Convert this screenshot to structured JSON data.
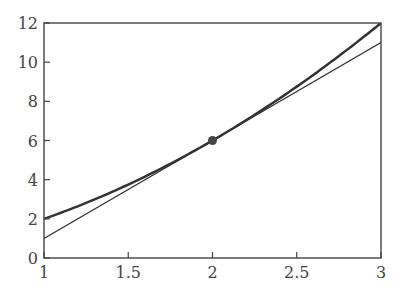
{
  "chart_data": {
    "type": "line",
    "title": "",
    "xlabel": "",
    "ylabel": "",
    "xlim": [
      1,
      3
    ],
    "ylim": [
      0,
      12
    ],
    "grid": false,
    "legend": null,
    "x_ticks": [
      1,
      1.5,
      2,
      2.5,
      3
    ],
    "x_tick_labels": [
      "1",
      "1.5",
      "2",
      "2.5",
      "3"
    ],
    "y_ticks": [
      0,
      2,
      4,
      6,
      8,
      10,
      12
    ],
    "y_tick_labels": [
      "0",
      "2",
      "4",
      "6",
      "8",
      "10",
      "12"
    ],
    "series": [
      {
        "name": "curve",
        "description": "y = x^2 + x",
        "x": [
          1,
          1.25,
          1.5,
          1.75,
          2,
          2.25,
          2.5,
          2.75,
          3
        ],
        "y": [
          2,
          2.8125,
          3.75,
          4.8125,
          6,
          7.3125,
          8.75,
          10.3125,
          12
        ],
        "color": "#333333",
        "line_width": 2.5
      },
      {
        "name": "tangent",
        "description": "tangent line at x=2, y = 5x - 4",
        "x": [
          1,
          3
        ],
        "y": [
          1,
          11
        ],
        "color": "#333333",
        "line_width": 1.2
      }
    ],
    "points": [
      {
        "name": "tangent-point",
        "x": 2,
        "y": 6,
        "color": "#444444"
      }
    ]
  }
}
